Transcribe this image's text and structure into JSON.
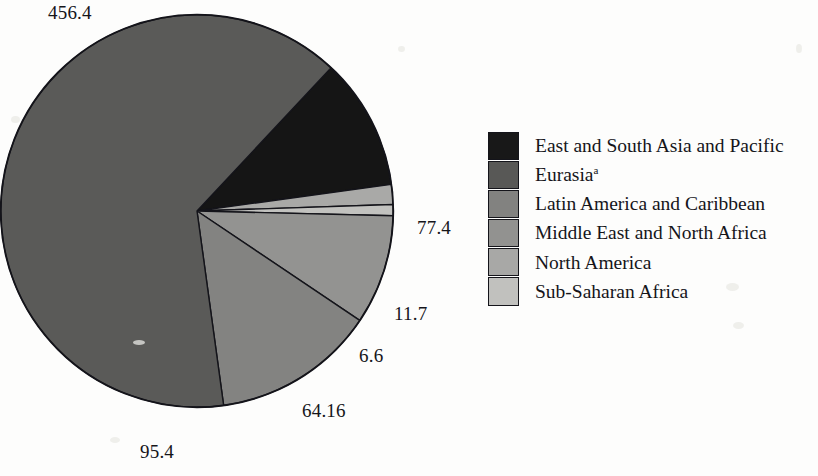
{
  "chart_data": {
    "type": "pie",
    "title": "",
    "subtitle": "",
    "xlabel": "",
    "ylabel": "",
    "legend_position": "right",
    "grid": false,
    "total": 711.66,
    "categories": [
      "East and South Asia and Pacific",
      "Eurasia",
      "Latin America and Caribbean",
      "Middle East and North Africa",
      "North America",
      "Sub-Saharan Africa"
    ],
    "values": [
      77.4,
      456.4,
      95.4,
      64.16,
      11.7,
      6.6
    ],
    "slices": [
      {
        "name": "East and South Asia and Pacific",
        "label": "77.4",
        "value": 77.4,
        "color": "#151515",
        "start_angle": -47,
        "sweep": 39.2
      },
      {
        "name": "North America",
        "label": "11.7",
        "value": 11.7,
        "color": "#a9a9a7",
        "start_angle": -7.8,
        "sweep": 5.9
      },
      {
        "name": "Sub-Saharan Africa",
        "label": "6.6",
        "value": 6.6,
        "color": "#c2c2bf",
        "start_angle": -1.9,
        "sweep": 3.3
      },
      {
        "name": "Middle East and North Africa",
        "label": "64.16",
        "value": 64.16,
        "color": "#939391",
        "start_angle": 1.4,
        "sweep": 32.5
      },
      {
        "name": "Latin America and Caribbean",
        "label": "95.4",
        "value": 95.4,
        "color": "#838381",
        "start_angle": 33.9,
        "sweep": 48.3
      },
      {
        "name": "Eurasia",
        "label": "456.4",
        "value": 456.4,
        "color": "#5a5a58",
        "start_angle": 82.2,
        "sweep": 230.9
      }
    ]
  },
  "value_labels": [
    {
      "name": "eurasia-value",
      "text": "456.4",
      "left": 48,
      "top": 2
    },
    {
      "name": "east-asia-value",
      "text": "77.4",
      "left": 417,
      "top": 217
    },
    {
      "name": "north-america-value",
      "text": "11.7",
      "left": 394,
      "top": 303
    },
    {
      "name": "sub-saharan-value",
      "text": "6.6",
      "left": 359,
      "top": 345
    },
    {
      "name": "middle-east-value",
      "text": "64.16",
      "left": 302,
      "top": 400
    },
    {
      "name": "latin-america-value",
      "text": "95.4",
      "left": 140,
      "top": 441
    }
  ],
  "legend": {
    "items": [
      {
        "label": "East and South Asia and Pacific",
        "sup": "",
        "color": "#181818"
      },
      {
        "label": "Eurasia",
        "sup": "a",
        "color": "#585856"
      },
      {
        "label": "Latin America and Caribbean",
        "sup": "",
        "color": "#828280"
      },
      {
        "label": "Middle East and North Africa",
        "sup": "",
        "color": "#929290"
      },
      {
        "label": "North America",
        "sup": "",
        "color": "#a8a8a6"
      },
      {
        "label": "Sub-Saharan Africa",
        "sup": "",
        "color": "#c1c1be"
      }
    ]
  },
  "colors": {
    "background": "#fdfdfc",
    "text": "#15151a",
    "outline": "#14141a"
  }
}
